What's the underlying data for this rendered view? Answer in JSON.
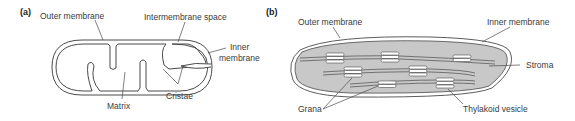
{
  "panel_a": {
    "tag": "(a)",
    "subject": "mitochondrion",
    "labels": {
      "outer_membrane": "Outer membrane",
      "intermembrane_space": "Intermembrane space",
      "inner_membrane_line1": "Inner",
      "inner_membrane_line2": "membrane",
      "matrix": "Matrix",
      "cristae": "Cristae"
    }
  },
  "panel_b": {
    "tag": "(b)",
    "subject": "chloroplast",
    "labels": {
      "outer_membrane": "Outer membrane",
      "inner_membrane": "Inner membrane",
      "stroma": "Stroma",
      "grana": "Grana",
      "thylakoid_vesicle": "Thylakoid vesicle"
    },
    "colors": {
      "stroma_fill": "#c8c8c8",
      "granum_fill": "#ffffff",
      "line": "#4a4a4a"
    }
  }
}
